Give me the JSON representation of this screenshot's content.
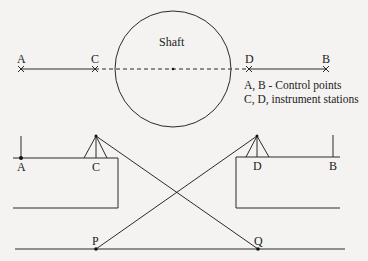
{
  "diagram": {
    "type": "shaft survey diagram",
    "plan_view": {
      "shaft_label": "Shaft",
      "points": [
        {
          "id": "A",
          "label": "A",
          "x": 21,
          "y": 69
        },
        {
          "id": "C",
          "label": "C",
          "x": 95,
          "y": 69
        },
        {
          "id": "D",
          "label": "D",
          "x": 249,
          "y": 69
        },
        {
          "id": "B",
          "label": "B",
          "x": 326,
          "y": 69
        }
      ],
      "legend": [
        "A, B - Control points",
        "C, D, instrument stations"
      ]
    },
    "section_view": {
      "labels": {
        "A": "A",
        "C": "C",
        "D": "D",
        "B": "B",
        "P": "P",
        "Q": "Q"
      }
    }
  },
  "colors": {
    "line": "#2a2a2a",
    "background": "#f4f3f1"
  }
}
